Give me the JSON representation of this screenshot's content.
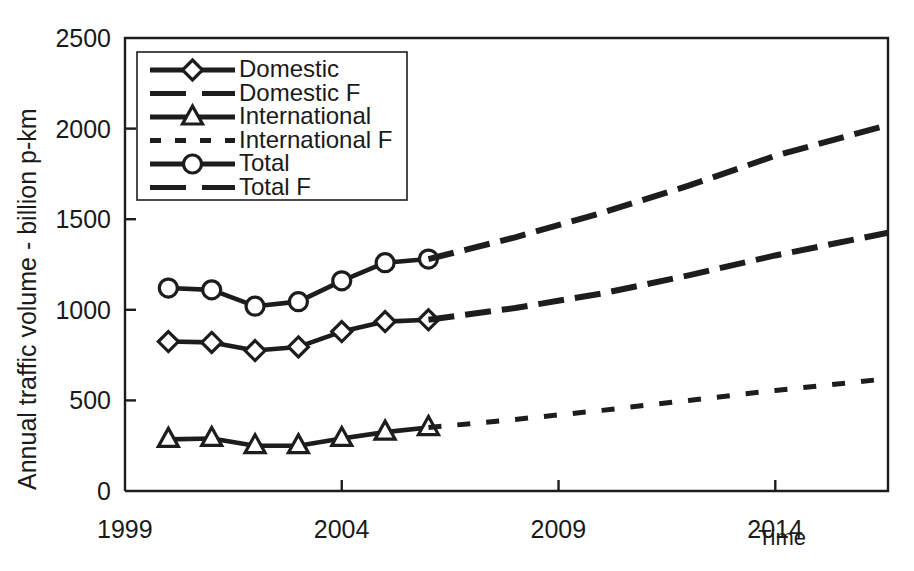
{
  "chart_data": {
    "type": "line",
    "title": "",
    "xlabel": "Time",
    "ylabel": "Annual traffic volume - billion p-km",
    "xlim": [
      1999,
      2016.6
    ],
    "ylim": [
      0,
      2500
    ],
    "grid": false,
    "legend_position": "top-left",
    "x_ticks": [
      1999,
      2004,
      2009,
      2014
    ],
    "x_tick_labels": [
      "1999",
      "2004",
      "2009",
      "2014"
    ],
    "y_ticks": [
      0,
      500,
      1000,
      1500,
      2000,
      2500
    ],
    "y_tick_labels": [
      "0",
      "500",
      "1000",
      "1500",
      "2000",
      "2500"
    ],
    "series": [
      {
        "name": "Domestic",
        "style": "solid-with-diamond-markers",
        "marker": "diamond",
        "x": [
          2000,
          2001,
          2002,
          2003,
          2004,
          2005,
          2006
        ],
        "values": [
          825,
          820,
          775,
          795,
          880,
          935,
          945
        ]
      },
      {
        "name": "Domestic F",
        "style": "long-dashed",
        "marker": "none",
        "x": [
          2006,
          2008,
          2010,
          2012,
          2014,
          2016.6
        ],
        "values": [
          945,
          1010,
          1090,
          1190,
          1300,
          1425
        ]
      },
      {
        "name": "International",
        "style": "solid-with-triangle-markers",
        "marker": "triangle",
        "x": [
          2000,
          2001,
          2002,
          2003,
          2004,
          2005,
          2006
        ],
        "values": [
          285,
          290,
          250,
          250,
          290,
          325,
          350
        ]
      },
      {
        "name": "International F",
        "style": "short-dashed",
        "marker": "none",
        "x": [
          2006,
          2008,
          2010,
          2012,
          2014,
          2016.6
        ],
        "values": [
          350,
          395,
          445,
          500,
          555,
          620
        ]
      },
      {
        "name": "Total",
        "style": "solid-with-circle-markers",
        "marker": "circle",
        "x": [
          2000,
          2001,
          2002,
          2003,
          2004,
          2005,
          2006
        ],
        "values": [
          1120,
          1110,
          1020,
          1045,
          1160,
          1260,
          1280
        ]
      },
      {
        "name": "Total F",
        "style": "long-dashed",
        "marker": "none",
        "x": [
          2006,
          2008,
          2010,
          2012,
          2014,
          2016.6
        ],
        "values": [
          1280,
          1400,
          1535,
          1685,
          1850,
          2020
        ]
      }
    ],
    "legend": [
      {
        "label": "Domestic",
        "marker": "diamond",
        "dash": "none"
      },
      {
        "label": "Domestic F",
        "marker": "none",
        "dash": "long"
      },
      {
        "label": "International",
        "marker": "triangle",
        "dash": "none"
      },
      {
        "label": "International F",
        "marker": "none",
        "dash": "short"
      },
      {
        "label": "Total",
        "marker": "circle",
        "dash": "none"
      },
      {
        "label": "Total F",
        "marker": "none",
        "dash": "long"
      }
    ],
    "colors": {
      "line": "#1d1d1d",
      "marker_fill": "#ffffff",
      "background": "#ffffff",
      "axis": "#1d1d1d"
    }
  }
}
